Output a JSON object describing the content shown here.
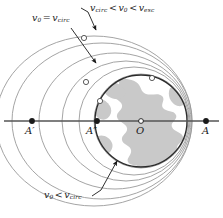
{
  "figure": {
    "name": "orbital-trajectories-diagram",
    "background_color": "#ffffff",
    "width": 223,
    "height": 218
  },
  "axis": {
    "name": "principal-axis",
    "color": "#555555",
    "y": 121,
    "x_start": 4,
    "x_end": 219
  },
  "points": [
    {
      "id": "A-prime",
      "label_main": "A",
      "label_prime": "′",
      "x": 32,
      "y": 121,
      "label_x": 25,
      "label_y": 126,
      "marker": "filled-dot"
    },
    {
      "id": "A-double-prime",
      "label_main": "A",
      "label_prime": "″",
      "x": 97,
      "y": 121,
      "label_x": 86,
      "label_y": 126,
      "marker": "filled-dot"
    },
    {
      "id": "O-center",
      "label_main": "O",
      "label_prime": "",
      "x": 141,
      "y": 121,
      "label_x": 136,
      "label_y": 126,
      "marker": "open-dot"
    },
    {
      "id": "A-right",
      "label_main": "A",
      "label_prime": "",
      "x": 206,
      "y": 121,
      "label_x": 202,
      "label_y": 126,
      "marker": "filled-dot"
    }
  ],
  "earth": {
    "name": "earth-globe",
    "cx": 141,
    "cy": 121,
    "r": 46,
    "outline_color": "#2b2b2b",
    "land_color": "#c9c9c9",
    "ocean_color": "#ffffff"
  },
  "orbits": [
    {
      "id": "orbit-inner-suborbital",
      "stroke": "#9a9a9a",
      "cx": 141,
      "cy": 121,
      "rx": 47,
      "ry": 47
    },
    {
      "id": "orbit-circular",
      "stroke": "#9a9a9a",
      "cx": 134,
      "cy": 121,
      "rx": 55,
      "ry": 54
    },
    {
      "id": "orbit-ellipse-1",
      "stroke": "#9a9a9a",
      "cx": 126,
      "cy": 121,
      "rx": 64,
      "ry": 60
    },
    {
      "id": "orbit-ellipse-2",
      "stroke": "#9a9a9a",
      "cx": 115,
      "cy": 121,
      "rx": 76,
      "ry": 68
    },
    {
      "id": "orbit-ellipse-3",
      "stroke": "#9a9a9a",
      "cx": 102,
      "cy": 121,
      "rx": 90,
      "ry": 78
    },
    {
      "id": "orbit-ellipse-outer",
      "stroke": "#9a9a9a",
      "cx": 94,
      "cy": 121,
      "rx": 98,
      "ry": 85
    }
  ],
  "markers": [
    {
      "id": "marker-outer-top",
      "x": 84,
      "y": 38,
      "r": 2.6
    },
    {
      "id": "marker-mid-left",
      "x": 86,
      "y": 82,
      "r": 2.6
    },
    {
      "id": "marker-inner-left",
      "x": 100,
      "y": 101,
      "r": 2.6
    },
    {
      "id": "marker-right-upper",
      "x": 152,
      "y": 78,
      "r": 2.6
    }
  ],
  "labels": {
    "v0_eq_vcirc": {
      "name": "label-v0-equals-vcirc",
      "v": "v",
      "sub0": "0",
      "relation": "=",
      "v2": "v",
      "sub2": "circ",
      "x": 32,
      "y": 18
    },
    "vcirc_lt_v0_lt_vesc": {
      "name": "label-vcirc-lt-v0-lt-vesc",
      "v1": "v",
      "sub1": "circ",
      "rel1": "<",
      "v2": "v",
      "sub2": "0",
      "rel2": "<",
      "v3": "v",
      "sub3": "esc",
      "x": 88,
      "y": 5
    },
    "v0_lt_vcirc": {
      "name": "label-v0-lt-vcirc",
      "v1": "v",
      "sub1": "0",
      "rel": "<",
      "v2": "v",
      "sub2": "circ",
      "x": 44,
      "y": 194
    }
  },
  "leaders": [
    {
      "id": "leader-v0-eq-vcirc",
      "x1": 71,
      "y1": 28,
      "x2": 97,
      "y2": 64,
      "arrow": true
    },
    {
      "id": "leader-vcirc-range",
      "x1": 88,
      "y1": 12,
      "x2": 97,
      "y2": 31,
      "arrow": true
    },
    {
      "id": "leader-vcirc-range-tick",
      "x1": 88,
      "y1": 12,
      "x2": 82,
      "y2": 9,
      "arrow": false
    },
    {
      "id": "leader-v0-lt-vcirc",
      "x1": 100,
      "y1": 191,
      "x2": 117,
      "y2": 160,
      "arrow": true
    },
    {
      "id": "leader-v0-lt-vcirc-tail",
      "x1": 100,
      "y1": 191,
      "x2": 92,
      "y2": 196,
      "arrow": false
    }
  ],
  "colors": {
    "ink": "#1a1a1a",
    "orbit_gray": "#9a9a9a",
    "axis_gray": "#555555",
    "land_gray": "#c9c9c9"
  }
}
